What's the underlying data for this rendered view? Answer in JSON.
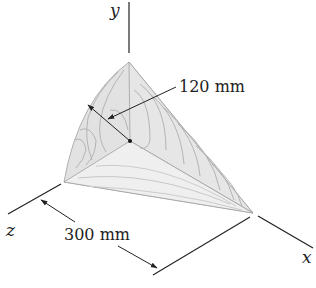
{
  "figure": {
    "axes": {
      "x_label": "x",
      "y_label": "y",
      "z_label": "z"
    },
    "dimensions": {
      "radius_label": "120 mm",
      "length_label": "300 mm"
    },
    "colors": {
      "solid_fill": "#e4e4e4",
      "solid_face_light": "#ececec",
      "grain": "#b8b8b8",
      "edge": "#9a9a9a",
      "ink": "#222222"
    }
  }
}
